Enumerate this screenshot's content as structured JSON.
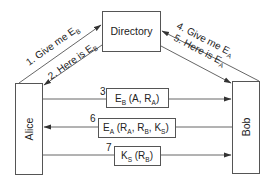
{
  "diagram": {
    "type": "key-distribution-protocol",
    "nodes": {
      "directory": {
        "label": "Directory"
      },
      "alice": {
        "label": "Alice"
      },
      "bob": {
        "label": "Bob"
      }
    },
    "edges": [
      {
        "id": "1",
        "from": "Alice",
        "to": "Directory",
        "prefix": "1. Give me E",
        "sub": "B"
      },
      {
        "id": "2",
        "from": "Directory",
        "to": "Alice",
        "prefix": "2. Here is E",
        "sub": "B"
      },
      {
        "id": "4",
        "from": "Bob",
        "to": "Directory",
        "prefix": "4. Give me E",
        "sub": "A"
      },
      {
        "id": "5",
        "from": "Directory",
        "to": "Bob",
        "prefix": "5. Here is E",
        "sub": "A"
      }
    ],
    "messages": [
      {
        "step": "3",
        "from": "Alice",
        "to": "Bob",
        "parts": {
          "e": "E",
          "e_sub": "B",
          "open": " (A, R",
          "r_sub": "A",
          "close": ")"
        }
      },
      {
        "step": "6",
        "from": "Bob",
        "to": "Alice",
        "parts": {
          "e": "E",
          "e_sub": "A",
          "open": " (R",
          "ra_sub": "A",
          "mid1": ", R",
          "rb_sub": "B",
          "mid2": ", K",
          "ks_sub": "S",
          "close": ")"
        }
      },
      {
        "step": "7",
        "from": "Alice",
        "to": "Bob",
        "parts": {
          "k": "K",
          "k_sub": "S",
          "open": " (R",
          "rb_sub": "B",
          "close": ")"
        }
      }
    ],
    "colors": {
      "stroke": "#555555",
      "text": "#222222",
      "background": "#ffffff"
    }
  }
}
